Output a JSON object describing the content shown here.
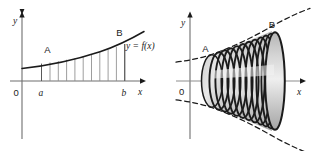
{
  "figure": {
    "background_color": "#ffffff",
    "ink_color": "#1b1b1b",
    "fill_gray": "#d8d8d8",
    "panels": [
      {
        "id": "left",
        "name": "area-under-curve",
        "axes": {
          "x_label": "x",
          "y_label": "y",
          "origin_label": "0"
        },
        "curve_label": "y = f(x)",
        "point_labels": [
          "A",
          "B"
        ],
        "tick_labels": [
          "a",
          "b"
        ],
        "strip_count": 11,
        "description": "Region under y = f(x) between x = a and x = b divided into vertical strips"
      },
      {
        "id": "right",
        "name": "solid-of-revolution",
        "axes": {
          "x_label": "x",
          "y_label": "y",
          "origin_label": "0"
        },
        "point_labels": [
          "A",
          "B"
        ],
        "disk_count": 11,
        "description": "Solid generated by revolving the region about the x-axis, approximated by circular disks"
      }
    ]
  }
}
